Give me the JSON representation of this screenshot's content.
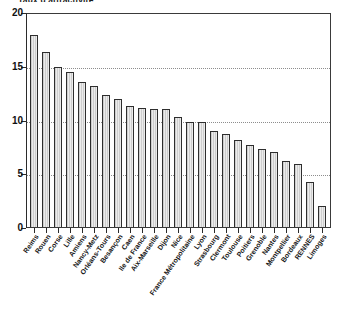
{
  "chart_data": {
    "type": "bar",
    "title": "Taux d'attractivité",
    "xlabel": "",
    "ylabel": "",
    "ylim": [
      0,
      20
    ],
    "yticks": [
      0,
      5,
      10,
      15,
      20
    ],
    "ytick_labels": [
      "0",
      "5",
      "10",
      "15",
      "20"
    ],
    "grid": true,
    "gridlines": [
      5,
      10,
      15
    ],
    "legend": "none",
    "categories": [
      "Reims",
      "Rouen",
      "Corse",
      "Lille",
      "Amiens",
      "Nancy-Metz",
      "Orléans-Tours",
      "Besançon",
      "Caen",
      "Ile de France",
      "Aix-Marseille",
      "Dijon",
      "Nice",
      "France Métropolitaine",
      "Lyon",
      "Strasbourg",
      "Clermont",
      "Toulouse",
      "Poitiers",
      "Grenoble",
      "Nantes",
      "Montpellier",
      "Bordeaux",
      "RENNES",
      "Limoges"
    ],
    "values": [
      18.0,
      16.4,
      15.0,
      14.6,
      13.6,
      13.2,
      12.4,
      12.0,
      11.4,
      11.2,
      11.1,
      11.1,
      10.3,
      9.9,
      9.9,
      9.0,
      8.7,
      8.2,
      7.7,
      7.3,
      7.0,
      6.2,
      5.9,
      4.2,
      2.0
    ],
    "colors": {
      "bar_fill": "#ececec",
      "bar_border": "#2e2e2e",
      "axis": "#2b2b2b",
      "grid": "#8d8d8d",
      "background": "#ffffff",
      "text": "#141414"
    }
  }
}
